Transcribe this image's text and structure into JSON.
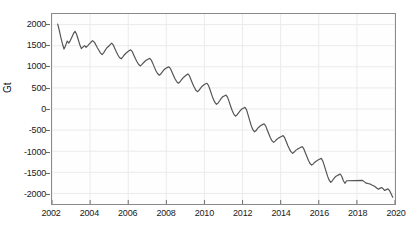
{
  "chart_data": {
    "type": "line",
    "title": "",
    "xlabel": "",
    "ylabel": "Gt",
    "xlim": [
      2002,
      2020
    ],
    "ylim": [
      -2250,
      2250
    ],
    "grid": true,
    "legend": "none",
    "line_color": "#555555",
    "axis_color": "#8a8a8a",
    "grid_color": "#ebebeb",
    "xticks": [
      2002,
      2004,
      2006,
      2008,
      2010,
      2012,
      2014,
      2016,
      2018,
      2020
    ],
    "xtick_labels": [
      "2002",
      "2004",
      "2006",
      "2008",
      "2010",
      "2012",
      "2014",
      "2016",
      "2018",
      "2020"
    ],
    "yticks": [
      2000,
      1500,
      1000,
      500,
      0,
      -500,
      -1000,
      -1500,
      -2000
    ],
    "ytick_labels": [
      "2000",
      "1500",
      "1000",
      "500",
      "0",
      "-500",
      "-1000",
      "-1500",
      "-2000"
    ],
    "series": [
      {
        "name": "mass-anomaly",
        "x": [
          2002.3,
          2002.38,
          2002.46,
          2002.55,
          2002.63,
          2002.71,
          2002.8,
          2002.88,
          2002.96,
          2003.04,
          2003.13,
          2003.21,
          2003.29,
          2003.38,
          2003.46,
          2003.54,
          2003.63,
          2003.71,
          2003.79,
          2003.88,
          2003.96,
          2004.04,
          2004.13,
          2004.21,
          2004.29,
          2004.38,
          2004.46,
          2004.54,
          2004.63,
          2004.71,
          2004.79,
          2004.88,
          2004.96,
          2005.04,
          2005.13,
          2005.21,
          2005.29,
          2005.38,
          2005.46,
          2005.54,
          2005.63,
          2005.71,
          2005.79,
          2005.88,
          2005.96,
          2006.04,
          2006.13,
          2006.21,
          2006.29,
          2006.38,
          2006.46,
          2006.54,
          2006.63,
          2006.71,
          2006.79,
          2006.88,
          2006.96,
          2007.04,
          2007.13,
          2007.21,
          2007.29,
          2007.38,
          2007.46,
          2007.54,
          2007.63,
          2007.71,
          2007.79,
          2007.88,
          2007.96,
          2008.04,
          2008.13,
          2008.21,
          2008.29,
          2008.38,
          2008.46,
          2008.54,
          2008.63,
          2008.71,
          2008.79,
          2008.88,
          2008.96,
          2009.04,
          2009.13,
          2009.21,
          2009.29,
          2009.38,
          2009.46,
          2009.54,
          2009.63,
          2009.71,
          2009.79,
          2009.88,
          2009.96,
          2010.04,
          2010.13,
          2010.21,
          2010.29,
          2010.38,
          2010.46,
          2010.54,
          2010.63,
          2010.71,
          2010.79,
          2010.88,
          2010.96,
          2011.04,
          2011.13,
          2011.21,
          2011.29,
          2011.38,
          2011.46,
          2011.54,
          2011.63,
          2011.71,
          2011.79,
          2011.88,
          2011.96,
          2012.04,
          2012.13,
          2012.21,
          2012.29,
          2012.38,
          2012.46,
          2012.54,
          2012.63,
          2012.71,
          2012.79,
          2012.88,
          2012.96,
          2013.04,
          2013.13,
          2013.21,
          2013.29,
          2013.38,
          2013.46,
          2013.54,
          2013.63,
          2013.71,
          2013.79,
          2013.88,
          2013.96,
          2014.04,
          2014.13,
          2014.21,
          2014.29,
          2014.38,
          2014.46,
          2014.54,
          2014.63,
          2014.71,
          2014.79,
          2014.88,
          2014.96,
          2015.04,
          2015.13,
          2015.21,
          2015.29,
          2015.38,
          2015.46,
          2015.54,
          2015.63,
          2015.71,
          2015.79,
          2015.88,
          2015.96,
          2016.04,
          2016.13,
          2016.21,
          2016.29,
          2016.38,
          2016.46,
          2016.54,
          2016.63,
          2016.71,
          2016.79,
          2016.88,
          2016.96,
          2017.04,
          2017.13,
          2017.21,
          2017.29,
          2017.38,
          2017.46,
          2018.3,
          2018.38,
          2018.46,
          2018.54,
          2018.63,
          2018.71,
          2018.79,
          2018.88,
          2018.96,
          2019.04,
          2019.13,
          2019.21,
          2019.29,
          2019.38,
          2019.46,
          2019.54,
          2019.63,
          2019.71,
          2019.79,
          2019.88
        ],
        "y": [
          2010,
          1870,
          1700,
          1540,
          1420,
          1500,
          1610,
          1560,
          1620,
          1700,
          1790,
          1840,
          1770,
          1640,
          1520,
          1430,
          1470,
          1500,
          1460,
          1500,
          1540,
          1580,
          1620,
          1590,
          1530,
          1450,
          1390,
          1330,
          1290,
          1330,
          1390,
          1450,
          1480,
          1520,
          1560,
          1520,
          1440,
          1350,
          1280,
          1220,
          1190,
          1230,
          1280,
          1320,
          1350,
          1380,
          1400,
          1360,
          1280,
          1190,
          1120,
          1060,
          1020,
          1050,
          1090,
          1130,
          1160,
          1180,
          1200,
          1160,
          1080,
          980,
          900,
          840,
          800,
          830,
          880,
          930,
          960,
          980,
          1000,
          960,
          880,
          790,
          710,
          650,
          610,
          640,
          690,
          740,
          770,
          800,
          830,
          790,
          700,
          600,
          520,
          450,
          410,
          440,
          490,
          540,
          570,
          590,
          610,
          560,
          460,
          340,
          240,
          160,
          110,
          140,
          190,
          250,
          290,
          310,
          330,
          280,
          180,
          60,
          -40,
          -120,
          -170,
          -140,
          -90,
          -40,
          0,
          20,
          40,
          -20,
          -140,
          -280,
          -400,
          -490,
          -540,
          -510,
          -460,
          -420,
          -390,
          -370,
          -350,
          -400,
          -490,
          -590,
          -680,
          -750,
          -790,
          -760,
          -720,
          -690,
          -670,
          -650,
          -630,
          -680,
          -770,
          -870,
          -950,
          -1010,
          -1050,
          -1020,
          -980,
          -950,
          -930,
          -910,
          -890,
          -940,
          -1030,
          -1130,
          -1220,
          -1290,
          -1330,
          -1300,
          -1260,
          -1230,
          -1210,
          -1190,
          -1170,
          -1230,
          -1340,
          -1470,
          -1590,
          -1680,
          -1740,
          -1700,
          -1650,
          -1600,
          -1580,
          -1560,
          -1540,
          -1600,
          -1700,
          -1760,
          -1700,
          -1690,
          -1720,
          -1750,
          -1760,
          -1770,
          -1780,
          -1800,
          -1820,
          -1840,
          -1870,
          -1900,
          -1880,
          -1860,
          -1890,
          -1930,
          -1910,
          -1890,
          -1930,
          -2000,
          -2090
        ]
      }
    ]
  }
}
